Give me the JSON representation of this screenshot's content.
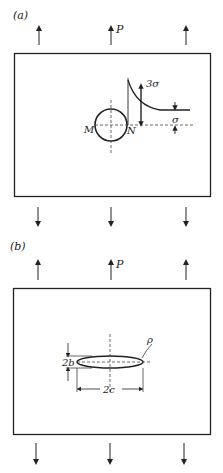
{
  "figure_a": {
    "label": "(a)",
    "load_label": "P",
    "peak_stress_label": "3σ",
    "far_stress_label": "σ",
    "point_left_label": "M",
    "point_right_label": "N"
  },
  "figure_b": {
    "label": "(b)",
    "load_label": "P",
    "height_label": "2b",
    "width_label": "2c",
    "radius_label": "ρ"
  }
}
